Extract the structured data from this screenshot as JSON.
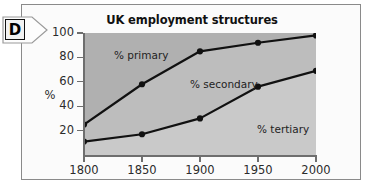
{
  "panel": {
    "marker_letter": "D"
  },
  "chart_data": {
    "type": "area",
    "title": "UK employment structures",
    "xlabel": "",
    "ylabel": "%",
    "grid": false,
    "legend_position": "inline-band-labels",
    "x": [
      1800,
      1850,
      1900,
      1950,
      2000
    ],
    "x_tick_labels": [
      "1800",
      "1850",
      "1900",
      "1950",
      "2000"
    ],
    "y_tick_labels": [
      "20",
      "40",
      "60",
      "80",
      "100"
    ],
    "y_ticks": [
      20,
      40,
      60,
      80,
      100
    ],
    "xlim": [
      1800,
      2000
    ],
    "ylim": [
      0,
      100
    ],
    "stacking": "cumulative",
    "series": [
      {
        "name": "% tertiary",
        "label": "% tertiary",
        "cumulative_boundary_values": [
          11,
          17,
          30,
          56,
          69
        ],
        "band_fill": "#c9c9c9",
        "marker": "circle"
      },
      {
        "name": "% secondary",
        "label": "% secondary",
        "cumulative_boundary_values": [
          25,
          58,
          85,
          92,
          98
        ],
        "band_fill": "#bdbdbd",
        "marker": "circle"
      },
      {
        "name": "% primary",
        "label": "% primary",
        "cumulative_boundary_values": [
          100,
          100,
          100,
          100,
          100
        ],
        "band_fill": "#b0b0b0",
        "marker": "none"
      }
    ],
    "annotations": [
      {
        "text": "% primary",
        "x": 1820,
        "y": 82
      },
      {
        "text": "% secondary",
        "x": 1885,
        "y": 58
      },
      {
        "text": "% tertiary",
        "x": 1945,
        "y": 20
      }
    ],
    "colors": {
      "line": "#111111",
      "axis": "#6e6e6e",
      "text": "#2b2b2b",
      "band_top": "#b0b0b0",
      "band_middle": "#bdbdbd",
      "band_bottom": "#c9c9c9"
    }
  }
}
